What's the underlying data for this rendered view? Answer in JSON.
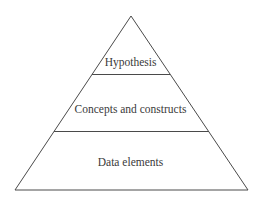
{
  "diagram": {
    "type": "pyramid",
    "levels": [
      {
        "label": "Hypothesis",
        "position": "top"
      },
      {
        "label": "Concepts and constructs",
        "position": "middle"
      },
      {
        "label": "Data elements",
        "position": "bottom"
      }
    ],
    "colors": {
      "stroke": "#4a4a4a",
      "text": "#3a3a3a",
      "background": "#ffffff"
    }
  }
}
